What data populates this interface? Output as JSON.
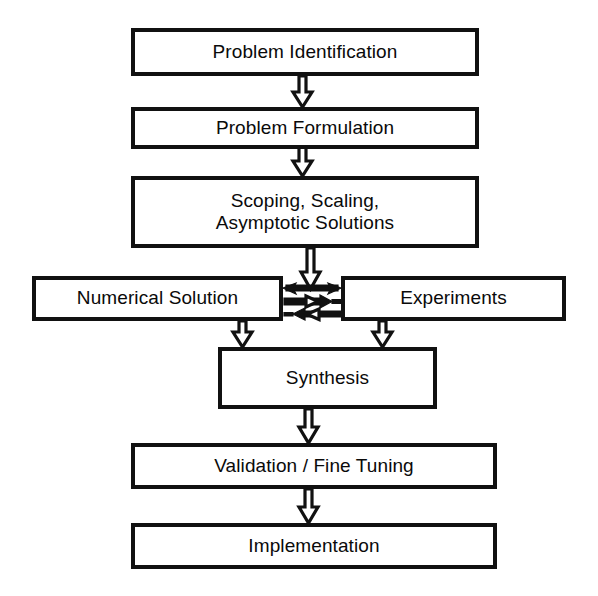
{
  "diagram": {
    "orientation": "top-to-bottom",
    "background_color": "#ffffff",
    "line_color": "#111111",
    "text_color": "#0a0a0a",
    "nodes": [
      {
        "id": "problem_identification",
        "label": "Problem Identification",
        "shape": "rectangle"
      },
      {
        "id": "problem_formulation",
        "label": "Problem Formulation",
        "shape": "rectangle"
      },
      {
        "id": "scoping",
        "label": "Scoping, Scaling,\nAsymptotic Solutions",
        "shape": "rectangle"
      },
      {
        "id": "numerical_solution",
        "label": "Numerical Solution",
        "shape": "rectangle"
      },
      {
        "id": "experiments",
        "label": "Experiments",
        "shape": "rectangle"
      },
      {
        "id": "synthesis",
        "label": "Synthesis",
        "shape": "rectangle"
      },
      {
        "id": "validation",
        "label": "Validation / Fine Tuning",
        "shape": "rectangle"
      },
      {
        "id": "implementation",
        "label": "Implementation",
        "shape": "rectangle"
      }
    ],
    "edges": [
      {
        "from": "problem_identification",
        "to": "problem_formulation",
        "style": "hollow-block-arrow",
        "direction": "down"
      },
      {
        "from": "problem_formulation",
        "to": "scoping",
        "style": "hollow-block-arrow",
        "direction": "down"
      },
      {
        "from": "scoping",
        "to": "numerical_solution_experiments_junction",
        "style": "hollow-block-arrow",
        "direction": "down"
      },
      {
        "from": "junction",
        "to": "numerical_solution",
        "style": "solid-arrow",
        "direction": "left"
      },
      {
        "from": "junction",
        "to": "experiments",
        "style": "solid-arrow",
        "direction": "right"
      },
      {
        "from": "numerical_solution",
        "to": "experiments",
        "style": "solid-arrow",
        "direction": "right"
      },
      {
        "from": "experiments",
        "to": "numerical_solution",
        "style": "solid-arrow",
        "direction": "left"
      },
      {
        "from": "numerical_solution",
        "to": "synthesis",
        "style": "hollow-block-arrow",
        "direction": "down"
      },
      {
        "from": "experiments",
        "to": "synthesis",
        "style": "hollow-block-arrow",
        "direction": "down"
      },
      {
        "from": "synthesis",
        "to": "validation",
        "style": "hollow-block-arrow",
        "direction": "down"
      },
      {
        "from": "validation",
        "to": "implementation",
        "style": "hollow-block-arrow",
        "direction": "down"
      }
    ]
  }
}
